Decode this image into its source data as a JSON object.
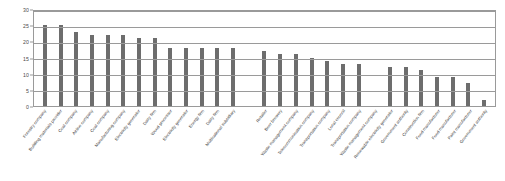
{
  "chart_data": {
    "type": "bar",
    "title": "",
    "subtitle": "",
    "xlabel": "",
    "ylabel": "",
    "ylim": [
      0,
      30
    ],
    "yticks": [
      0,
      5,
      10,
      15,
      20,
      25,
      30
    ],
    "grid": true,
    "legend": "none",
    "bar_color": "#6d6d6d",
    "frame_color": "#9a9a9a",
    "categories": [
      "Forestry company",
      "Building materials provider",
      "Coal company",
      "Airline company",
      "Coal company",
      "Manufacturing company",
      "Electricity generator",
      "Dairy firm",
      "Wood processor",
      "Electricity generator",
      "Energy firm",
      "Dairy firm",
      "Multinational subsidiary",
      "",
      "Retailer",
      "Beer brewery",
      "Waste management company",
      "Telecommunication company",
      "Transportation company",
      "Local council",
      "Transportation company",
      "Waste management company",
      "Renewable electricity generator",
      "Government authority",
      "Construction firm",
      "Food manufacturer",
      "Food manufacturer",
      "Paint manufacturer",
      "Government authority"
    ],
    "values": [
      25,
      25,
      23,
      22,
      22,
      22,
      21,
      21,
      18,
      18,
      18,
      18,
      18,
      0,
      17,
      16,
      16,
      15,
      14,
      13,
      13,
      0,
      12,
      12,
      11,
      9,
      9,
      7,
      2
    ]
  }
}
